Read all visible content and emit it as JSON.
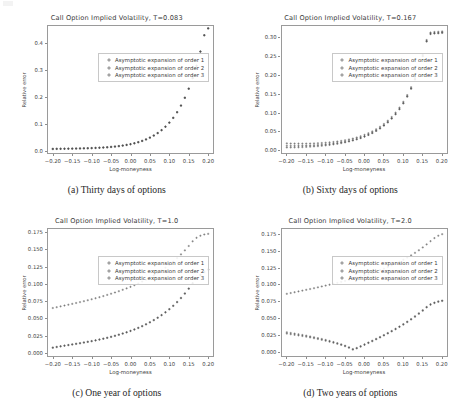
{
  "figure": {
    "panel_labels": [
      "(a)",
      "(b)",
      "(c)",
      "(d)"
    ],
    "captions": [
      "(a) Thirty days of options",
      "(b) Sixty days of options",
      "(c) One year of options",
      "(d) Two years of options"
    ],
    "legend_entries": [
      "Asymptotic expansion of order 1",
      "Asymptotic expansion of order 2",
      "Asymptotic expansion of order 3"
    ],
    "marker_icon": "plus-marker-icon",
    "marker_color": "#4a4a4a",
    "frame_color": "#9a9a9a",
    "background": "#ffffff"
  },
  "chart_data": [
    {
      "type": "scatter",
      "panel": "a",
      "title": "Call Option Implied Volatility, T=0.083",
      "xlabel": "Log-moneyness",
      "ylabel": "Relative error",
      "xlim": [
        -0.215,
        0.215
      ],
      "ylim": [
        -0.012,
        0.468
      ],
      "xticks": [
        -0.2,
        -0.15,
        -0.1,
        -0.05,
        0.0,
        0.05,
        0.1,
        0.15,
        0.2
      ],
      "xticklabels": [
        "−0.20",
        "−0.15",
        "−0.10",
        "−0.05",
        "0.00",
        "0.05",
        "0.10",
        "0.15",
        "0.20"
      ],
      "yticks": [
        0.0,
        0.1,
        0.2,
        0.3,
        0.4
      ],
      "yticklabels": [
        "0.0",
        "0.1",
        "0.2",
        "0.3",
        "0.4"
      ],
      "grid": false,
      "legend_position": "upper left",
      "x": [
        -0.2,
        -0.19,
        -0.18,
        -0.17,
        -0.16,
        -0.15,
        -0.14,
        -0.13,
        -0.12,
        -0.11,
        -0.1,
        -0.09,
        -0.08,
        -0.07,
        -0.06,
        -0.05,
        -0.04,
        -0.03,
        -0.02,
        -0.01,
        0.0,
        0.01,
        0.02,
        0.03,
        0.04,
        0.05,
        0.06,
        0.07,
        0.08,
        0.09,
        0.1,
        0.11,
        0.12,
        0.13,
        0.14,
        0.15,
        0.16,
        0.17,
        0.18,
        0.19,
        0.2
      ],
      "series": [
        {
          "name": "Asymptotic expansion of order 1",
          "values": [
            0.0075,
            0.0078,
            0.008,
            0.0082,
            0.0084,
            0.0086,
            0.0089,
            0.0092,
            0.0096,
            0.01,
            0.0105,
            0.0111,
            0.0118,
            0.0126,
            0.0136,
            0.0148,
            0.0162,
            0.0179,
            0.0199,
            0.0223,
            0.0251,
            0.0285,
            0.0325,
            0.0372,
            0.0428,
            0.0494,
            0.0572,
            0.0664,
            0.0773,
            0.0901,
            0.1052,
            0.123,
            0.144,
            0.1687,
            0.1977,
            0.2315,
            0.271,
            0.3168,
            0.3697,
            0.4304,
            0.456
          ]
        },
        {
          "name": "Asymptotic expansion of order 2",
          "values": [
            0.0068,
            0.0071,
            0.0073,
            0.0075,
            0.0078,
            0.008,
            0.0083,
            0.0087,
            0.0091,
            0.0095,
            0.01,
            0.0106,
            0.0113,
            0.0121,
            0.0131,
            0.0143,
            0.0157,
            0.0174,
            0.0194,
            0.0218,
            0.0246,
            0.028,
            0.032,
            0.0367,
            0.0423,
            0.0489,
            0.0567,
            0.0659,
            0.0768,
            0.0896,
            0.1047,
            0.1225,
            0.1435,
            0.1682,
            0.1972,
            0.231,
            0.2705,
            0.3163,
            0.3692,
            0.4299,
            0.4555
          ]
        },
        {
          "name": "Asymptotic expansion of order 3",
          "values": [
            0.0062,
            0.0065,
            0.0067,
            0.0069,
            0.0072,
            0.0074,
            0.0077,
            0.0081,
            0.0085,
            0.0089,
            0.0094,
            0.01,
            0.0107,
            0.0115,
            0.0125,
            0.0137,
            0.0151,
            0.0168,
            0.0188,
            0.0212,
            0.024,
            0.0274,
            0.0314,
            0.0361,
            0.0417,
            0.0483,
            0.0561,
            0.0653,
            0.0762,
            0.089,
            0.1041,
            0.1219,
            0.1429,
            0.1676,
            0.1966,
            0.2304,
            0.2699,
            0.3157,
            0.3686,
            0.4293,
            0.4549
          ]
        }
      ]
    },
    {
      "type": "scatter",
      "panel": "b",
      "title": "Call Option Implied Volatility, T=0.167",
      "xlabel": "Log-moneyness",
      "ylabel": "Relative error",
      "xlim": [
        -0.215,
        0.215
      ],
      "ylim": [
        -0.01,
        0.332
      ],
      "xticks": [
        -0.2,
        -0.15,
        -0.1,
        -0.05,
        0.0,
        0.05,
        0.1,
        0.15,
        0.2
      ],
      "xticklabels": [
        "−0.20",
        "−0.15",
        "−0.10",
        "−0.05",
        "0.00",
        "0.05",
        "0.10",
        "0.15",
        "0.20"
      ],
      "yticks": [
        0.0,
        0.05,
        0.1,
        0.15,
        0.2,
        0.25,
        0.3
      ],
      "yticklabels": [
        "0.00",
        "0.05",
        "0.10",
        "0.15",
        "0.20",
        "0.25",
        "0.30"
      ],
      "grid": false,
      "legend_position": "upper left",
      "x": [
        -0.2,
        -0.19,
        -0.18,
        -0.17,
        -0.16,
        -0.15,
        -0.14,
        -0.13,
        -0.12,
        -0.11,
        -0.1,
        -0.09,
        -0.08,
        -0.07,
        -0.06,
        -0.05,
        -0.04,
        -0.03,
        -0.02,
        -0.01,
        0.0,
        0.01,
        0.02,
        0.03,
        0.04,
        0.05,
        0.06,
        0.07,
        0.08,
        0.09,
        0.1,
        0.11,
        0.12,
        0.13,
        0.14,
        0.15,
        0.16,
        0.17,
        0.18,
        0.19,
        0.2
      ],
      "series": [
        {
          "name": "Asymptotic expansion of order 1",
          "values": [
            0.0182,
            0.0178,
            0.0176,
            0.0175,
            0.0175,
            0.0176,
            0.0178,
            0.0181,
            0.0186,
            0.0192,
            0.0199,
            0.0208,
            0.0219,
            0.0232,
            0.0247,
            0.0265,
            0.0286,
            0.031,
            0.0338,
            0.037,
            0.0407,
            0.045,
            0.0499,
            0.0556,
            0.0621,
            0.0696,
            0.0782,
            0.0881,
            0.0996,
            0.1129,
            0.1283,
            0.1462,
            0.1671,
            0.1915,
            0.22,
            0.2533,
            0.2922,
            0.312,
            0.3135,
            0.314,
            0.315
          ]
        },
        {
          "name": "Asymptotic expansion of order 2",
          "values": [
            0.0118,
            0.0117,
            0.0117,
            0.0118,
            0.012,
            0.0123,
            0.0127,
            0.0132,
            0.0138,
            0.0145,
            0.0154,
            0.0164,
            0.0176,
            0.019,
            0.0206,
            0.0224,
            0.0245,
            0.0269,
            0.0297,
            0.0329,
            0.0366,
            0.0409,
            0.0458,
            0.0515,
            0.058,
            0.0655,
            0.0741,
            0.084,
            0.0955,
            0.1088,
            0.1242,
            0.1421,
            0.163,
            0.1874,
            0.2159,
            0.2492,
            0.2881,
            0.3079,
            0.3094,
            0.3099,
            0.3109
          ]
        },
        {
          "name": "Asymptotic expansion of order 3",
          "values": [
            0.0072,
            0.0073,
            0.0075,
            0.0078,
            0.0082,
            0.0087,
            0.0093,
            0.01,
            0.0108,
            0.0117,
            0.0128,
            0.014,
            0.0154,
            0.017,
            0.0188,
            0.0208,
            0.0231,
            0.0257,
            0.0287,
            0.0321,
            0.036,
            0.0404,
            0.0455,
            0.0513,
            0.0579,
            0.0655,
            0.0742,
            0.0842,
            0.0958,
            0.1092,
            0.1247,
            0.1427,
            0.1637,
            0.1882,
            0.2168,
            0.2502,
            0.2892,
            0.309,
            0.3105,
            0.311,
            0.312
          ]
        }
      ]
    },
    {
      "type": "scatter",
      "panel": "c",
      "title": "Call Option Implied Volatility, T=1.0",
      "xlabel": "Log-moneyness",
      "ylabel": "Relative error",
      "xlim": [
        -0.215,
        0.215
      ],
      "ylim": [
        -0.006,
        0.181
      ],
      "xticks": [
        -0.2,
        -0.15,
        -0.1,
        -0.05,
        0.0,
        0.05,
        0.1,
        0.15,
        0.2
      ],
      "xticklabels": [
        "−0.20",
        "−0.15",
        "−0.10",
        "−0.05",
        "0.00",
        "0.05",
        "0.10",
        "0.15",
        "0.20"
      ],
      "yticks": [
        0.0,
        0.025,
        0.05,
        0.075,
        0.1,
        0.125,
        0.15,
        0.175
      ],
      "yticklabels": [
        "0.000",
        "0.025",
        "0.050",
        "0.075",
        "0.100",
        "0.125",
        "0.150",
        "0.175"
      ],
      "grid": false,
      "legend_position": "upper left",
      "x": [
        -0.2,
        -0.19,
        -0.18,
        -0.17,
        -0.16,
        -0.15,
        -0.14,
        -0.13,
        -0.12,
        -0.11,
        -0.1,
        -0.09,
        -0.08,
        -0.07,
        -0.06,
        -0.05,
        -0.04,
        -0.03,
        -0.02,
        -0.01,
        0.0,
        0.01,
        0.02,
        0.03,
        0.04,
        0.05,
        0.06,
        0.07,
        0.08,
        0.09,
        0.1,
        0.11,
        0.12,
        0.13,
        0.14,
        0.15,
        0.16,
        0.17,
        0.18,
        0.19,
        0.2
      ],
      "series": [
        {
          "name": "Asymptotic expansion of order 1",
          "values": [
            0.065,
            0.0662,
            0.0674,
            0.0686,
            0.0698,
            0.071,
            0.0723,
            0.0736,
            0.0749,
            0.0763,
            0.0777,
            0.0792,
            0.0807,
            0.0823,
            0.084,
            0.0857,
            0.0875,
            0.0894,
            0.0914,
            0.0935,
            0.0957,
            0.0981,
            0.1006,
            0.1033,
            0.1061,
            0.1091,
            0.1123,
            0.1158,
            0.1195,
            0.1235,
            0.1278,
            0.1324,
            0.1374,
            0.1428,
            0.1486,
            0.1549,
            0.1617,
            0.1668,
            0.1698,
            0.1716,
            0.1725
          ]
        },
        {
          "name": "Asymptotic expansion of order 2",
          "values": [
            0.0072,
            0.0083,
            0.0093,
            0.0102,
            0.0111,
            0.012,
            0.0129,
            0.0138,
            0.0148,
            0.0158,
            0.0168,
            0.0179,
            0.0191,
            0.0203,
            0.0216,
            0.023,
            0.0245,
            0.0261,
            0.0278,
            0.0296,
            0.0316,
            0.0337,
            0.036,
            0.0385,
            0.0412,
            0.0441,
            0.0473,
            0.0507,
            0.0545,
            0.0586,
            0.0631,
            0.068,
            0.0734,
            0.0793,
            0.0858,
            0.0929,
            0.1007,
            0.1078,
            0.1128,
            0.117,
            0.1205
          ]
        },
        {
          "name": "Asymptotic expansion of order 3",
          "values": [
            0.0078,
            0.0088,
            0.0097,
            0.0106,
            0.0115,
            0.0124,
            0.0133,
            0.0142,
            0.0152,
            0.0162,
            0.0172,
            0.0183,
            0.0195,
            0.0207,
            0.022,
            0.0234,
            0.0249,
            0.0265,
            0.0282,
            0.03,
            0.032,
            0.0341,
            0.0364,
            0.0389,
            0.0416,
            0.0445,
            0.0477,
            0.0511,
            0.0549,
            0.059,
            0.0635,
            0.0684,
            0.0738,
            0.0797,
            0.0862,
            0.0933,
            0.1011,
            0.1082,
            0.1132,
            0.1174,
            0.1209
          ]
        }
      ]
    },
    {
      "type": "scatter",
      "panel": "d",
      "title": "Call Option Implied Volatility, T=2.0",
      "xlabel": "Log-moneyness",
      "ylabel": "Relative error",
      "xlim": [
        -0.215,
        0.215
      ],
      "ylim": [
        -0.008,
        0.184
      ],
      "xticks": [
        -0.2,
        -0.15,
        -0.1,
        -0.05,
        0.0,
        0.05,
        0.1,
        0.15,
        0.2
      ],
      "xticklabels": [
        "−0.20",
        "−0.15",
        "−0.10",
        "−0.05",
        "0.00",
        "0.05",
        "0.10",
        "0.15",
        "0.20"
      ],
      "yticks": [
        0.0,
        0.025,
        0.05,
        0.075,
        0.1,
        0.125,
        0.15,
        0.175
      ],
      "yticklabels": [
        "0.000",
        "0.025",
        "0.050",
        "0.075",
        "0.100",
        "0.125",
        "0.150",
        "0.175"
      ],
      "grid": false,
      "legend_position": "upper left",
      "x": [
        -0.2,
        -0.19,
        -0.18,
        -0.17,
        -0.16,
        -0.15,
        -0.14,
        -0.13,
        -0.12,
        -0.11,
        -0.1,
        -0.09,
        -0.08,
        -0.07,
        -0.06,
        -0.05,
        -0.04,
        -0.03,
        -0.02,
        -0.01,
        0.0,
        0.01,
        0.02,
        0.03,
        0.04,
        0.05,
        0.06,
        0.07,
        0.08,
        0.09,
        0.1,
        0.11,
        0.12,
        0.13,
        0.14,
        0.15,
        0.16,
        0.17,
        0.18,
        0.19,
        0.2
      ],
      "series": [
        {
          "name": "Asymptotic expansion of order 1",
          "values": [
            0.086,
            0.0872,
            0.0884,
            0.0896,
            0.0908,
            0.092,
            0.0932,
            0.0944,
            0.0957,
            0.097,
            0.0983,
            0.0996,
            0.101,
            0.1024,
            0.1038,
            0.1053,
            0.1068,
            0.1084,
            0.11,
            0.1117,
            0.1135,
            0.1153,
            0.1172,
            0.1192,
            0.1213,
            0.1235,
            0.1258,
            0.1283,
            0.1309,
            0.1337,
            0.1367,
            0.1399,
            0.1433,
            0.147,
            0.1509,
            0.1551,
            0.1596,
            0.1644,
            0.169,
            0.1725,
            0.1748
          ]
        },
        {
          "name": "Asymptotic expansion of order 2",
          "values": [
            0.0288,
            0.0278,
            0.0268,
            0.0258,
            0.0248,
            0.0238,
            0.0226,
            0.0214,
            0.0201,
            0.0188,
            0.0174,
            0.0159,
            0.0143,
            0.0126,
            0.0108,
            0.0088,
            0.0064,
            0.0038,
            0.0055,
            0.0081,
            0.0108,
            0.0135,
            0.0162,
            0.019,
            0.0218,
            0.0247,
            0.0277,
            0.0308,
            0.034,
            0.0374,
            0.0409,
            0.0446,
            0.0485,
            0.0526,
            0.057,
            0.0616,
            0.0665,
            0.0705,
            0.073,
            0.0748,
            0.076
          ]
        },
        {
          "name": "Asymptotic expansion of order 3",
          "values": [
            0.0268,
            0.0259,
            0.025,
            0.0241,
            0.0232,
            0.0222,
            0.0211,
            0.02,
            0.0188,
            0.0175,
            0.0162,
            0.0148,
            0.0133,
            0.0117,
            0.01,
            0.0081,
            0.0058,
            0.003,
            0.0048,
            0.0074,
            0.0101,
            0.0128,
            0.0155,
            0.0183,
            0.0211,
            0.024,
            0.027,
            0.0301,
            0.0333,
            0.0367,
            0.0402,
            0.0439,
            0.0478,
            0.0519,
            0.0563,
            0.0609,
            0.0658,
            0.0698,
            0.0723,
            0.0741,
            0.0753
          ]
        }
      ]
    }
  ]
}
